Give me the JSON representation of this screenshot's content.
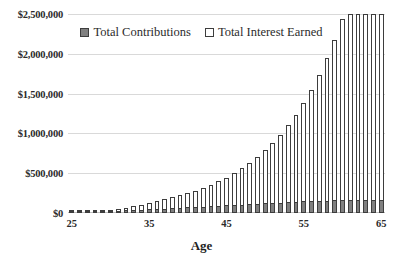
{
  "chart_data": {
    "type": "bar",
    "title": "",
    "subtitle": "",
    "xlabel": "Age",
    "ylabel": "",
    "stacked": true,
    "grid": true,
    "legend_position": "top-center",
    "xlim": [
      25,
      65
    ],
    "ylim": [
      0,
      2500000
    ],
    "ytick_labels": [
      "$0",
      "$500,000",
      "$1,000,000",
      "$1,500,000",
      "$2,000,000",
      "$2,500,000"
    ],
    "ytick_values": [
      0,
      500000,
      1000000,
      1500000,
      2000000,
      2500000
    ],
    "xtick_labels": [
      "25",
      "35",
      "45",
      "55",
      "65"
    ],
    "xtick_values": [
      25,
      35,
      45,
      55,
      65
    ],
    "categories": [
      25,
      26,
      27,
      28,
      29,
      30,
      31,
      32,
      33,
      34,
      35,
      36,
      37,
      38,
      39,
      40,
      41,
      42,
      43,
      44,
      45,
      46,
      47,
      48,
      49,
      50,
      51,
      52,
      53,
      54,
      55,
      56,
      57,
      58,
      59,
      60,
      61,
      62,
      63,
      64,
      65
    ],
    "series": [
      {
        "name": "Total Contributions",
        "color": "#808080",
        "values": [
          4000,
          8000,
          12000,
          16000,
          20000,
          24000,
          28000,
          32000,
          36000,
          40000,
          45000,
          50000,
          55000,
          60000,
          65000,
          70000,
          75000,
          80000,
          85000,
          90000,
          95000,
          100000,
          105000,
          110000,
          115000,
          120000,
          125000,
          130000,
          135000,
          140000,
          145000,
          149000,
          152000,
          155000,
          158000,
          160000,
          161500,
          163000,
          164000,
          164500,
          165000
        ]
      },
      {
        "name": "Total Interest Earned",
        "color": "#ffffff",
        "values": [
          300,
          1400,
          3600,
          7000,
          11800,
          18200,
          26400,
          36800,
          49600,
          65100,
          84000,
          106500,
          132900,
          163700,
          199400,
          240500,
          287800,
          341800,
          403200,
          472800,
          551500,
          640200,
          739900,
          851800,
          977200,
          1117500,
          1274200,
          1449100,
          1643900,
          1860800,
          2102000,
          2369700,
          2667000,
          2997300,
          3363700,
          3770500,
          4221200,
          4720600,
          5273500,
          5885200,
          6562000
        ]
      }
    ],
    "series_totals": [
      4300,
      9400,
      15600,
      23000,
      31800,
      42200,
      54400,
      68800,
      85600,
      105100,
      129000,
      156500,
      187900,
      223700,
      264400,
      310500,
      362800,
      421800,
      488200,
      562800,
      646500,
      740200,
      844900,
      961800,
      1092200,
      1237500,
      1399200,
      1579100,
      1778900,
      2000800,
      2247000,
      2518700,
      2819000,
      3152300,
      3521700,
      3930500,
      4382700,
      4883600,
      5437500,
      6049700,
      6727000
    ],
    "display_totals": [
      4300,
      9400,
      15600,
      23000,
      31800,
      42200,
      54400,
      68800,
      85600,
      105100,
      129000,
      150000,
      172000,
      196000,
      222000,
      250000,
      281000,
      316000,
      355000,
      398000,
      446000,
      500000,
      560000,
      627000,
      702000,
      786000,
      880000,
      985000,
      1103000,
      1235000,
      1383000,
      1549000,
      1735000,
      1943000,
      2176000,
      2437000,
      2730000,
      3058000,
      3426000,
      3838000,
      4300000
    ]
  },
  "legend": {
    "items": [
      {
        "label": "Total Contributions",
        "swatch": "filled-square-icon"
      },
      {
        "label": "Total Interest Earned",
        "swatch": "hollow-square-icon"
      }
    ]
  },
  "axis": {
    "x_title": "Age"
  }
}
